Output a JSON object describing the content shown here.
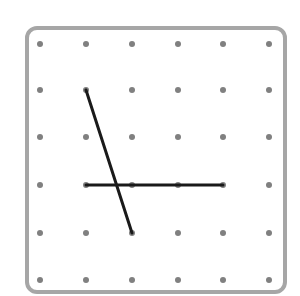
{
  "geoboard": {
    "border_color": "#a6a6a6",
    "dot_color": "#808080",
    "line_color": "#1a1a1a",
    "grid": {
      "columns": 6,
      "rows": 6,
      "x": [
        40,
        86,
        132,
        178,
        223,
        269
      ],
      "y": [
        44,
        90,
        137,
        185,
        233,
        280
      ]
    },
    "segments": [
      {
        "from": [
          1,
          1
        ],
        "to": [
          2,
          4
        ]
      },
      {
        "from": [
          1,
          3
        ],
        "to": [
          4,
          3
        ]
      }
    ]
  }
}
